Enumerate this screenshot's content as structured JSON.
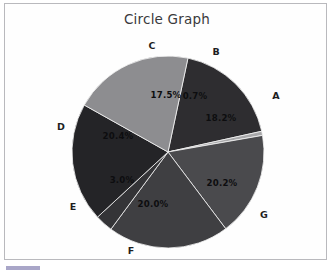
{
  "figure": {
    "title": "Circle Graph",
    "background_color": "#fefefe",
    "frame_color": "#b9b9bd"
  },
  "chart_data": {
    "type": "pie",
    "title": "Circle Graph",
    "xlabel": "",
    "ylabel": "",
    "legend_position": "none",
    "grid": false,
    "categories": [
      "A",
      "B",
      "C",
      "D",
      "E",
      "F",
      "G"
    ],
    "values": [
      18.2,
      0.7,
      17.5,
      20.4,
      3.0,
      20.0,
      20.2
    ],
    "value_unit": "percent",
    "total": 100.0,
    "start_angle_deg": -78,
    "direction": "clockwise",
    "slices": [
      {
        "label": "A",
        "percent_text": "18.2%",
        "value": 18.2,
        "color": "#2e2d30",
        "label_x": 276,
        "label_y": 95,
        "pct_x": 221,
        "pct_y": 118
      },
      {
        "label": "B",
        "percent_text": "0.7%",
        "value": 0.7,
        "color": "#a8a8aa",
        "label_x": 216,
        "label_y": 51,
        "pct_x": 195,
        "pct_y": 96
      },
      {
        "label": "C",
        "percent_text": "17.5%",
        "value": 17.5,
        "color": "#4a4a4d",
        "label_x": 152,
        "label_y": 45,
        "pct_x": 166,
        "pct_y": 95
      },
      {
        "label": "D",
        "percent_text": "20.4%",
        "value": 20.4,
        "color": "#3f3f42",
        "label_x": 61,
        "label_y": 126,
        "pct_x": 118,
        "pct_y": 136
      },
      {
        "label": "E",
        "percent_text": "3.0%",
        "value": 3.0,
        "color": "#343437",
        "label_x": 73,
        "label_y": 206,
        "pct_x": 122,
        "pct_y": 180
      },
      {
        "label": "F",
        "percent_text": "20.0%",
        "value": 20.0,
        "color": "#242427",
        "label_x": 131,
        "label_y": 250,
        "pct_x": 153,
        "pct_y": 204
      },
      {
        "label": "G",
        "percent_text": "20.2%",
        "value": 20.2,
        "color": "#8d8d90",
        "label_x": 264,
        "label_y": 214,
        "pct_x": 222,
        "pct_y": 183
      }
    ],
    "geometry": {
      "center_x": 168,
      "center_y": 152,
      "radius": 96
    }
  }
}
